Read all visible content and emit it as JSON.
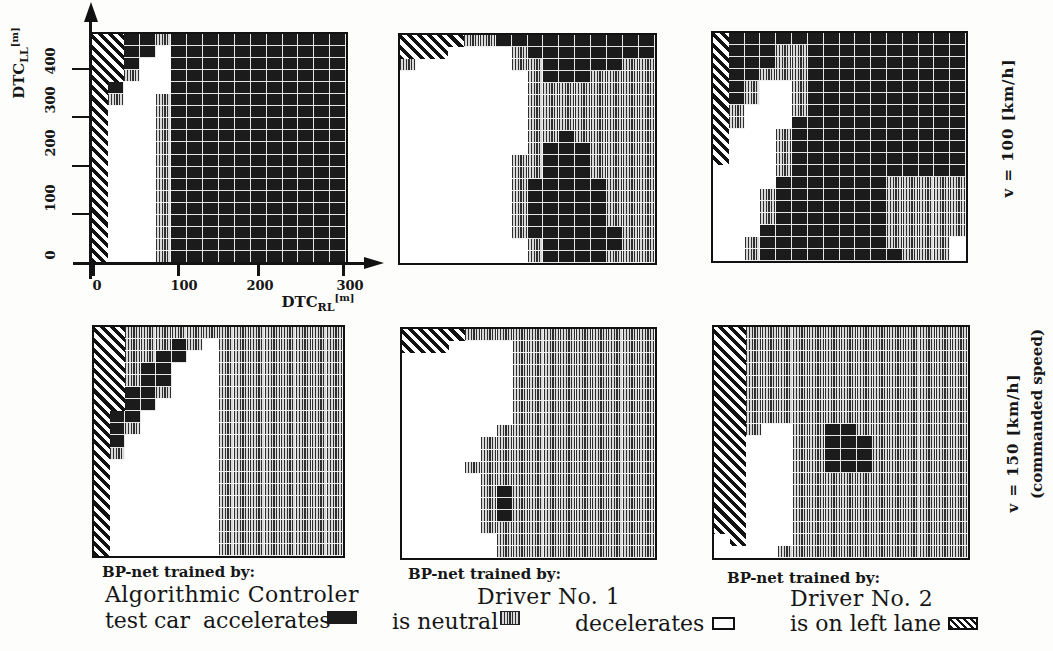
{
  "figure": {
    "axes": {
      "y": {
        "label_main": "DTC",
        "label_sub": "LL",
        "label_unit": "[m]",
        "ticks": [
          "0",
          "100",
          "200",
          "300",
          "400"
        ]
      },
      "x": {
        "label_main": "DTC",
        "label_sub": "RL",
        "label_unit": "[m]",
        "ticks": [
          "0",
          "100",
          "200",
          "300"
        ]
      }
    },
    "row_labels": {
      "top": {
        "text": "v = 100 [km/h]"
      },
      "bottom": {
        "text": "v = 150 [km/h]",
        "note": "(commanded speed)"
      }
    },
    "columns": [
      {
        "caption_prefix": "BP-net trained by:",
        "trainer": "Algorithmic Controler"
      },
      {
        "caption_prefix": "BP-net trained by:",
        "trainer": "Driver No. 1"
      },
      {
        "caption_prefix": "BP-net trained by:",
        "trainer": "Driver No. 2"
      }
    ],
    "legend": {
      "prefix": "test car",
      "items": [
        {
          "label": "accelerates",
          "code": "D",
          "color": "#1b1b1b"
        },
        {
          "label": "is neutral",
          "code": "N",
          "color": "#9a9a9a"
        },
        {
          "label": "decelerates",
          "code": "W",
          "color": "#ffffff"
        },
        {
          "label": "is on left lane",
          "code": "H",
          "pattern": "diagonal-hatch"
        }
      ]
    }
  },
  "chart_data": [
    {
      "type": "heatmap",
      "title": "BP-net trained by: Algorithmic Controler",
      "speed": "v = 100 [km/h]",
      "trainer": "Algorithmic Controler",
      "xlabel": "DTC_RL [m]",
      "ylabel": "DTC_LL [m]",
      "x_ticks": [
        0,
        100,
        200,
        300
      ],
      "y_ticks": [
        0,
        100,
        200,
        300,
        400
      ],
      "x_range": [
        0,
        305
      ],
      "y_range": [
        0,
        475
      ],
      "n_cols": 16,
      "n_rows": 19,
      "codes": {
        "D": "accelerates",
        "N": "is neutral",
        "W": "decelerates",
        "H": "is on left lane"
      },
      "grid_rows_top_to_bottom": [
        "HHDDNDDDDDDDDDDD",
        "HHDDWDDDDDDDDDDD",
        "HHDWWDDDDDDDDDDD",
        "HHNWWDDDDDDDDDDD",
        "HDWWWDDDDDDDDDDD",
        "HNWWNDDDDDDDDDDD",
        "HWWWNDDDDDDDDDDD",
        "HWWWNDDDDDDDDDDD",
        "HWWWNDDDDDDDDDDD",
        "HWWWNDDDDDDDDDDD",
        "HWWWNDDDDDDDDDDD",
        "HWWWNDDDDDDDDDDD",
        "HWWWNDDDDDDDDDDD",
        "HWWWNDDDDDDDDDDD",
        "HWWWNDDDDDDDDDDD",
        "HWWWNDDDDDDDDDDD",
        "HWWWNDDDDDDDDDDD",
        "HWWWNDDDDDDDDDDD",
        "HWWWNDDDDDDDDDDD"
      ]
    },
    {
      "type": "heatmap",
      "title": "BP-net trained by: Driver No. 1",
      "speed": "v = 100 [km/h]",
      "trainer": "Driver No. 1",
      "xlabel": "DTC_RL [m]",
      "ylabel": "DTC_LL [m]",
      "x_range": [
        0,
        305
      ],
      "y_range": [
        0,
        475
      ],
      "n_cols": 16,
      "n_rows": 19,
      "codes": {
        "D": "accelerates",
        "N": "is neutral",
        "W": "decelerates",
        "H": "is on left lane"
      },
      "grid_rows_top_to_bottom": [
        "HHHHNNDDDDDDDDDD",
        "HHHWWWWNDDDDDDDD",
        "NWWWWWWNNDDDDDNN",
        "WWWWWWWWNDDDNNNN",
        "WWWWWWWWNNNNNNNN",
        "WWWWWWWWNNNNNNNN",
        "WWWWWWWWNNNNNNNN",
        "WWWWWWWWNNNNNNNN",
        "WWWWWWWWNNDNNNNN",
        "WWWWWWWWNDDDNNNN",
        "WWWWWWWNNDDDNNNN",
        "WWWWWWWNNDDDNNNN",
        "WWWWWWWNDDDDDNNN",
        "WWWWWWWNDDDDDNNN",
        "WWWWWWWNDDDDDNNN",
        "WWWWWWWNDDDDDNNN",
        "WWWWWWWNDDDDDDNN",
        "WWWWWWWWNDDDDDNN",
        "WWWWWWWWNDDDDNNN"
      ]
    },
    {
      "type": "heatmap",
      "title": "BP-net trained by: Driver No. 2",
      "speed": "v = 100 [km/h]",
      "trainer": "Driver No. 2",
      "xlabel": "DTC_RL [m]",
      "ylabel": "DTC_LL [m]",
      "x_range": [
        0,
        305
      ],
      "y_range": [
        0,
        475
      ],
      "n_cols": 16,
      "n_rows": 19,
      "codes": {
        "D": "accelerates",
        "N": "is neutral",
        "W": "decelerates",
        "H": "is on left lane"
      },
      "grid_rows_top_to_bottom": [
        "HDDDDDDDDDDDDDDD",
        "HDDDNNDDDDDDDDDD",
        "HDDDNNDDDDDDDDDD",
        "HDDNNNDDDDDDDDDD",
        "HDNWWNDDDDDDDDDD",
        "HDNWWNDDDDDDDDDD",
        "HNWWWNDDDDDDDDDD",
        "HNWWWDDDDDDDDDDD",
        "HWWWNDDDDDDDDDDD",
        "HWWWNDDDDDDDDDDD",
        "HWWWNDDDDDDDDDDD",
        "WWWWNDDDDDDDDDDD",
        "WWWWDDDDDDDNNNNN",
        "WWWNDDDDDDDNNNNN",
        "WWWNDDDDDDDNNNNN",
        "WWWNDDDDDDDNNNNN",
        "WWWDDDDDDDDNNNNN",
        "WWNDDDDDDDDNNNNW",
        "WWNDDDDDDDDDNNNW"
      ]
    },
    {
      "type": "heatmap",
      "title": "BP-net trained by: Algorithmic Controler",
      "speed": "v = 150 [km/h] (commanded speed)",
      "trainer": "Algorithmic Controler",
      "xlabel": "DTC_RL [m]",
      "ylabel": "DTC_LL [m]",
      "x_range": [
        0,
        305
      ],
      "y_range": [
        0,
        475
      ],
      "n_cols": 16,
      "n_rows": 19,
      "codes": {
        "D": "accelerates",
        "N": "is neutral",
        "W": "decelerates",
        "H": "is on left lane"
      },
      "grid_rows_top_to_bottom": [
        "HHNNNNNNNNNNNNNN",
        "HHNNNDNWNNNNNNNN",
        "HHNNDDWWNNNNNNNN",
        "HHNDDWWWNNNNNNNN",
        "HHNDDWWWNNNNNNNN",
        "HHDDNWWWNNNNNNNN",
        "HHDDWWWWNNNNNNNN",
        "HDDWWWWWNNNNNNNN",
        "HDNWWWWWNNNNNNNN",
        "HDWWWWWWNNNNNNNN",
        "HNWWWWWWNNNNNNNN",
        "HWWWWWWWNNNNNNNN",
        "HWWWWWWWNNNNNNNN",
        "HWWWWWWWNNNNNNNN",
        "HWWWWWWWNNNNNNNN",
        "HWWWWWWWNNNNNNNN",
        "HWWWWWWWNNNNNNNN",
        "HWWWWWWWNNNNNNNN",
        "HWWWWWWWNNNNNNNN"
      ]
    },
    {
      "type": "heatmap",
      "title": "BP-net trained by: Driver No. 1",
      "speed": "v = 150 [km/h] (commanded speed)",
      "trainer": "Driver No. 1",
      "xlabel": "DTC_RL [m]",
      "ylabel": "DTC_LL [m]",
      "x_range": [
        0,
        305
      ],
      "y_range": [
        0,
        475
      ],
      "n_cols": 16,
      "n_rows": 19,
      "codes": {
        "D": "accelerates",
        "N": "is neutral",
        "W": "decelerates",
        "H": "is on left lane"
      },
      "grid_rows_top_to_bottom": [
        "HHHHNNNNNNNNNNNN",
        "HHHWWWWNNNNNNNNN",
        "WWWWWWWNNNNNNNNN",
        "WWWWWWWNNNNNNNNN",
        "WWWWWWWNNNNNNNNN",
        "WWWWWWWNNNNNNNNN",
        "WWWWWWWNNNNNNNNN",
        "WWWWWWWNNNNNNNNN",
        "WWWWWWNNNNNNNNNN",
        "WWWWWNNNNNNNNNNN",
        "WWWWWNNNNNNNNNNN",
        "WWWWNNNNNNNNNNNN",
        "WWWWWNNNNNNNNNNN",
        "WWWWWNDNNNNNNNNN",
        "WWWWWNDNNNNNNNNN",
        "WWWWWNDNNNNNNNNN",
        "WWWWWNNNNNNNNNNN",
        "WWWWWWNNNNNNNNNN",
        "WWWWWWNNNNNNNNNN"
      ]
    },
    {
      "type": "heatmap",
      "title": "BP-net trained by: Driver No. 2",
      "speed": "v = 150 [km/h] (commanded speed)",
      "trainer": "Driver No. 2",
      "xlabel": "DTC_RL [m]",
      "ylabel": "DTC_LL [m]",
      "x_range": [
        0,
        305
      ],
      "y_range": [
        0,
        475
      ],
      "n_cols": 16,
      "n_rows": 19,
      "codes": {
        "D": "accelerates",
        "N": "is neutral",
        "W": "decelerates",
        "H": "is on left lane"
      },
      "grid_rows_top_to_bottom": [
        "HHNNNNNNNNNNNNNN",
        "HHNNNNNNNNNNNNNN",
        "HHNNNNNNNNNNNNNN",
        "HHNNNNNNNNNNNNNN",
        "HHNNNNNNNNNNNNNN",
        "HHNNNNNNNNNNNNNN",
        "HHNNNNNNNNNNNNNN",
        "HHNNNNNNNNNNNNNN",
        "HHNWWNNDDNNNNNNN",
        "HHWWWNNDDDNNNNNN",
        "HHWWWNNDDDNNNNNN",
        "HHWWWNNDDDNNNNNN",
        "HHWWWNNNNNNNNNNN",
        "HHWWWNNNNNNNNNNN",
        "HHWWWNNNNNNNNNNN",
        "HHWWWNNNNNNNNNNN",
        "HHWWWNNNNNNNNNNN",
        "WHWWWNNNNNNNNNNN",
        "WWWWNNNNNNNNNNNN"
      ]
    }
  ]
}
